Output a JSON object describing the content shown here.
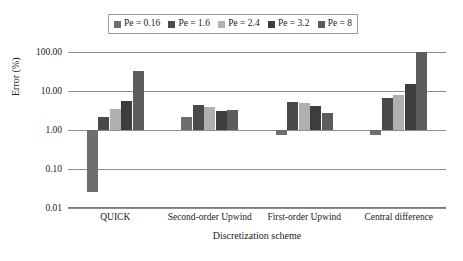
{
  "chart_data": {
    "type": "bar",
    "title": "",
    "xlabel": "Discretization scheme",
    "ylabel": "Error (%)",
    "yscale": "log",
    "ylim": [
      0.01,
      100.0
    ],
    "yticks": [
      "0.01",
      "0.10",
      "1.00",
      "10.00",
      "100.00"
    ],
    "ytick_values": [
      0.01,
      0.1,
      1.0,
      10.0,
      100.0
    ],
    "baseline": 1.0,
    "grid": true,
    "legend_position": "top-center",
    "categories": [
      "QUICK",
      "Second-order Upwind",
      "First-order Upwind",
      "Central difference"
    ],
    "series": [
      {
        "name": "Pe = 0.16",
        "color": "#6e6e6e",
        "values": [
          0.025,
          2.1,
          0.75,
          0.75
        ]
      },
      {
        "name": "Pe = 1.6",
        "color": "#4a4a4a",
        "values": [
          2.2,
          4.3,
          5.2,
          6.5
        ]
      },
      {
        "name": "Pe = 2.4",
        "color": "#b0b0b0",
        "values": [
          3.5,
          3.8,
          4.9,
          8.0
        ]
      },
      {
        "name": "Pe = 3.2",
        "color": "#3d3d3d",
        "values": [
          5.5,
          3.0,
          4.2,
          15.0
        ]
      },
      {
        "name": "Pe = 8",
        "color": "#5c5c5c",
        "values": [
          33.0,
          3.2,
          2.7,
          100.0
        ]
      }
    ]
  },
  "axis": {
    "ylabel": "Error (%)",
    "xlabel": "Discretization scheme"
  }
}
